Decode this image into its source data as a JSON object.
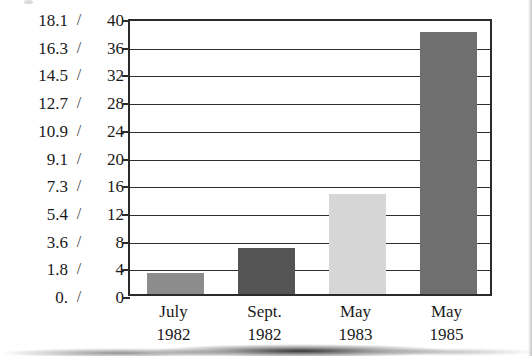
{
  "chart_data": {
    "type": "bar",
    "title": "",
    "subtitle": "",
    "xlabel": "",
    "ylabel": "",
    "grid": true,
    "legend": null,
    "categories": [
      "July 1982",
      "Sept. 1982",
      "May 1983",
      "May 1985"
    ],
    "category_lines": [
      {
        "name": "July",
        "year": "1982"
      },
      {
        "name": "Sept.",
        "year": "1982"
      },
      {
        "name": "May",
        "year": "1983"
      },
      {
        "name": "May",
        "year": "1985"
      }
    ],
    "values": [
      3.1,
      6.6,
      14.4,
      37.8
    ],
    "ylim": [
      0,
      40
    ],
    "secondary_ylim": [
      0,
      18.1
    ],
    "axis_separator": "/",
    "left_tick_labels": [
      "18.1",
      "16.3",
      "14.5",
      "12.7",
      "10.9",
      "9.1",
      "7.3",
      "5.4",
      "3.6",
      "1.8",
      "0."
    ],
    "right_tick_labels": [
      "40",
      "36",
      "32",
      "28",
      "24",
      "20",
      "16",
      "12",
      "8",
      "4",
      "0"
    ],
    "tick_values": [
      40,
      36,
      32,
      28,
      24,
      20,
      16,
      12,
      8,
      4,
      0
    ],
    "bar_colors": [
      "#8c8c8c",
      "#545454",
      "#d6d6d6",
      "#6f6f6f"
    ],
    "series": [
      {
        "name": "",
        "values": [
          3.1,
          6.6,
          14.4,
          37.8
        ],
        "secondary_values": [
          1.4,
          3.0,
          6.5,
          17.1
        ]
      }
    ]
  },
  "style": {
    "axis_color": "#2b2b2b",
    "grid_color": "#2f2f2f",
    "background": "#ffffff",
    "text_color": "#1a1a1a"
  }
}
